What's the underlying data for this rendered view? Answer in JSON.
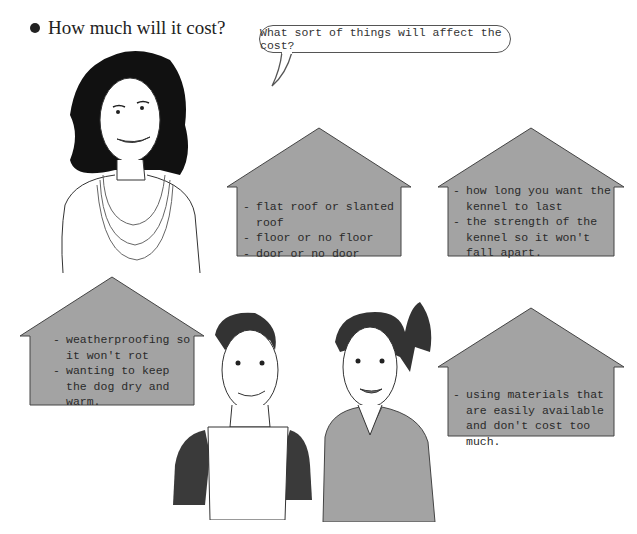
{
  "heading": {
    "bullet": "•",
    "text": "How much will it cost?"
  },
  "speech_bubble": {
    "text": "What sort of things will affect the cost?"
  },
  "houses": [
    {
      "id": "design",
      "fill": "#a3a3a3",
      "items": [
        "flat roof or slanted roof",
        "floor or no floor",
        "door or no door"
      ]
    },
    {
      "id": "durability",
      "fill": "#a3a3a3",
      "items": [
        "how long you want the kennel to last",
        "the strength of the kennel so it won't fall apart."
      ]
    },
    {
      "id": "weather",
      "fill": "#a3a3a3",
      "items": [
        "weatherproofing so it won't rot",
        "wanting to keep the dog dry and warm."
      ]
    },
    {
      "id": "materials",
      "fill": "#a3a3a3",
      "items": [
        "using materials that are easily available and don't cost too much."
      ]
    }
  ],
  "illustrations": [
    {
      "name": "woman-with-necklaces"
    },
    {
      "name": "boy-in-tshirt"
    },
    {
      "name": "girl-with-ponytail"
    }
  ]
}
